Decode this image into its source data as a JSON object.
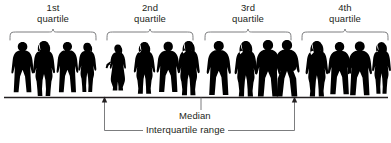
{
  "figure": {
    "type": "diagram",
    "width": 391,
    "height": 143,
    "background_color": "#ffffff",
    "ink_color": "#231f20",
    "line_color": "#6d6e71",
    "silhouette_color": "#000000"
  },
  "quartiles": [
    {
      "id": "q1",
      "label": "1st\nquartile",
      "label_line1": "1st",
      "label_line2": "quartile",
      "brace": {
        "x_start": 10,
        "x_end": 96,
        "y": 40,
        "depth": 9
      },
      "label_box": {
        "x": 18,
        "y": 3,
        "width": 70
      },
      "person_count": 4
    },
    {
      "id": "q2",
      "label": "2nd\nquartile",
      "label_line1": "2nd",
      "label_line2": "quartile",
      "brace": {
        "x_start": 107,
        "x_end": 193,
        "y": 40,
        "depth": 9
      },
      "label_box": {
        "x": 115,
        "y": 3,
        "width": 70
      },
      "person_count": 4
    },
    {
      "id": "q3",
      "label": "3rd\nquartile",
      "label_line1": "3rd",
      "label_line2": "quartile",
      "brace": {
        "x_start": 205,
        "x_end": 291,
        "y": 40,
        "depth": 9
      },
      "label_box": {
        "x": 213,
        "y": 3,
        "width": 70
      },
      "person_count": 4
    },
    {
      "id": "q4",
      "label": "4th\nquartile",
      "label_line1": "4th",
      "label_line2": "quartile",
      "brace": {
        "x_start": 302,
        "x_end": 388,
        "y": 40,
        "depth": 9
      },
      "label_box": {
        "x": 310,
        "y": 3,
        "width": 70
      },
      "person_count": 4
    }
  ],
  "baseline": {
    "y": 97,
    "x_start": 4,
    "x_end": 388,
    "color": "#231f20"
  },
  "annotations": {
    "median": {
      "label": "Median",
      "tick_x": 201,
      "tick_y_top": 97,
      "tick_y_bottom": 112,
      "label_x": 176,
      "label_y": 112
    },
    "interquartile_range": {
      "label": "Interquartile range",
      "left_x": 104,
      "right_x": 295,
      "y_baseline": 97,
      "y_bracket": 130,
      "label_x": 146,
      "label_y": 124
    }
  },
  "people": [
    {
      "quartile": "q1",
      "index": 0,
      "pose": "man-standing-hands-down",
      "x": 12,
      "scale": 0.96
    },
    {
      "quartile": "q1",
      "index": 1,
      "pose": "woman-standing-long-hair",
      "x": 34,
      "scale": 1.0
    },
    {
      "quartile": "q1",
      "index": 2,
      "pose": "man-standing-arms-side",
      "x": 57,
      "scale": 0.95
    },
    {
      "quartile": "q1",
      "index": 3,
      "pose": "woman-standing-slim",
      "x": 78,
      "scale": 0.93
    },
    {
      "quartile": "q2",
      "index": 0,
      "pose": "woman-hand-on-hip-dress",
      "x": 108,
      "scale": 0.9
    },
    {
      "quartile": "q2",
      "index": 1,
      "pose": "woman-standing-coat",
      "x": 135,
      "scale": 0.95
    },
    {
      "quartile": "q2",
      "index": 2,
      "pose": "man-standing-jacket",
      "x": 158,
      "scale": 0.93
    },
    {
      "quartile": "q2",
      "index": 3,
      "pose": "woman-standing-long-hair",
      "x": 179,
      "scale": 0.97
    },
    {
      "quartile": "q3",
      "index": 0,
      "pose": "man-standing-hands-down",
      "x": 208,
      "scale": 0.98
    },
    {
      "quartile": "q3",
      "index": 1,
      "pose": "woman-standing-long-hair",
      "x": 236,
      "scale": 0.99
    },
    {
      "quartile": "q3",
      "index": 2,
      "pose": "man-standing-arms-side",
      "x": 257,
      "scale": 1.0
    },
    {
      "quartile": "q3",
      "index": 3,
      "pose": "man-hands-in-pockets",
      "x": 276,
      "scale": 1.0
    },
    {
      "quartile": "q4",
      "index": 0,
      "pose": "woman-standing-long-hair",
      "x": 307,
      "scale": 0.99
    },
    {
      "quartile": "q4",
      "index": 1,
      "pose": "man-standing-jacket",
      "x": 329,
      "scale": 0.96
    },
    {
      "quartile": "q4",
      "index": 2,
      "pose": "man-standing-arms-side",
      "x": 349,
      "scale": 0.98
    },
    {
      "quartile": "q4",
      "index": 3,
      "pose": "woman-standing-slim",
      "x": 372,
      "scale": 0.95
    }
  ]
}
